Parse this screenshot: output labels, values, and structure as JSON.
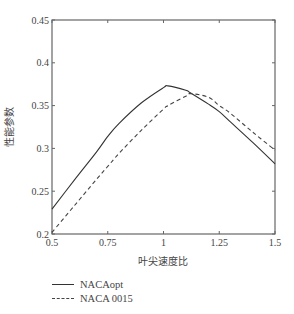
{
  "chart_data": {
    "type": "line",
    "title": "",
    "xlabel": "叶尖速度比",
    "ylabel": "性能参数",
    "xlim": [
      0.5,
      1.5
    ],
    "ylim": [
      0.2,
      0.45
    ],
    "xticks": [
      0.5,
      0.75,
      1,
      1.25,
      1.5
    ],
    "xtick_labels": [
      "0.5",
      "0.75",
      "1",
      "1.25",
      "1.5"
    ],
    "yticks": [
      0.2,
      0.25,
      0.3,
      0.35,
      0.4,
      0.45
    ],
    "ytick_labels": [
      "0.2",
      "0.25",
      "0.3",
      "0.35",
      "0.4",
      "0.45"
    ],
    "grid": false,
    "legend_position": "below",
    "x": [
      0.5,
      0.6,
      0.7,
      0.75,
      0.8,
      0.9,
      1.0,
      1.02,
      1.1,
      1.12,
      1.2,
      1.25,
      1.3,
      1.4,
      1.5
    ],
    "series": [
      {
        "name": "NACAopt",
        "style": "solid",
        "values": [
          0.229,
          0.263,
          0.296,
          0.314,
          0.329,
          0.353,
          0.371,
          0.373,
          0.368,
          0.365,
          0.352,
          0.343,
          0.331,
          0.307,
          0.282
        ]
      },
      {
        "name": "NACA 0015",
        "style": "dashed",
        "values": [
          0.202,
          0.233,
          0.264,
          0.279,
          0.294,
          0.321,
          0.346,
          0.35,
          0.361,
          0.364,
          0.36,
          0.35,
          0.341,
          0.319,
          0.298
        ]
      }
    ]
  },
  "colors": {
    "axis": "#666666",
    "solid_line": "#333333",
    "dashed_line": "#444444"
  },
  "legend": {
    "items": [
      {
        "label": "NACAopt",
        "style": "solid"
      },
      {
        "label": "NACA 0015",
        "style": "dashed"
      }
    ]
  }
}
